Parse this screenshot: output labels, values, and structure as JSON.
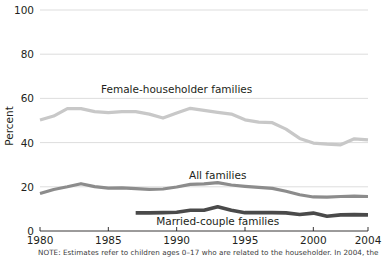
{
  "chart_data": {
    "type": "line",
    "title": "",
    "xlabel": "",
    "ylabel": "Percent",
    "xlim": [
      1980,
      2004
    ],
    "ylim": [
      0,
      100
    ],
    "grid": "horizontal",
    "legend_position": "inline-annotations",
    "x": [
      1980,
      1981,
      1982,
      1983,
      1984,
      1985,
      1986,
      1987,
      1988,
      1989,
      1990,
      1991,
      1992,
      1993,
      1994,
      1995,
      1996,
      1997,
      1998,
      1999,
      2000,
      2001,
      2002,
      2003,
      2004
    ],
    "xticks": [
      1980,
      1985,
      1990,
      1995,
      2000,
      2004
    ],
    "xtick_labels": [
      "1980",
      "1985",
      "1990",
      "1995",
      "2000",
      "2004"
    ],
    "yticks": [
      0,
      20,
      40,
      60,
      80,
      100
    ],
    "ytick_labels": [
      "0",
      "20",
      "40",
      "60",
      "80",
      "100"
    ],
    "series": [
      {
        "name": "Female-householder families",
        "color": "#c8c8c8",
        "line_width": 3.2,
        "label_x": 1990,
        "label_y": 64,
        "x": [
          1980,
          1981,
          1982,
          1983,
          1984,
          1985,
          1986,
          1987,
          1988,
          1989,
          1990,
          1991,
          1992,
          1993,
          1994,
          1995,
          1996,
          1997,
          1998,
          1999,
          2000,
          2001,
          2002,
          2003,
          2004
        ],
        "values": [
          50.2,
          52.0,
          55.4,
          55.4,
          54.0,
          53.6,
          54.0,
          54.0,
          52.9,
          51.1,
          53.4,
          55.5,
          54.6,
          53.7,
          52.9,
          50.3,
          49.3,
          49.0,
          46.1,
          41.9,
          39.8,
          39.3,
          39.0,
          41.7,
          41.2
        ]
      },
      {
        "name": "All families",
        "color": "#8c8c8c",
        "line_width": 3.2,
        "label_x": 1993,
        "label_y": 25,
        "x": [
          1980,
          1981,
          1982,
          1983,
          1984,
          1985,
          1986,
          1987,
          1988,
          1989,
          1990,
          1991,
          1992,
          1993,
          1994,
          1995,
          1996,
          1997,
          1998,
          1999,
          2000,
          2001,
          2002,
          2003,
          2004
        ],
        "values": [
          17.0,
          18.8,
          20.0,
          21.4,
          20.1,
          19.4,
          19.5,
          19.2,
          18.8,
          19.0,
          19.9,
          21.1,
          21.3,
          21.9,
          20.8,
          20.2,
          19.7,
          19.3,
          18.0,
          16.4,
          15.4,
          15.3,
          15.6,
          15.8,
          15.6
        ]
      },
      {
        "name": "Married-couple families",
        "color": "#4a4a4a",
        "line_width": 3.6,
        "label_x": 1993,
        "label_y": 4,
        "x": [
          1987,
          1988,
          1989,
          1990,
          1991,
          1992,
          1993,
          1994,
          1995,
          1996,
          1997,
          1998,
          1999,
          2000,
          2001,
          2002,
          2003,
          2004
        ],
        "values": [
          8.2,
          8.2,
          8.3,
          8.5,
          9.4,
          9.4,
          11.0,
          9.4,
          8.3,
          8.3,
          8.3,
          8.2,
          7.5,
          8.1,
          6.7,
          7.3,
          7.4,
          7.3
        ]
      }
    ],
    "note": "NOTE: Estimates refer to children ages 0–17 who are related to the householder. In 2004, the"
  }
}
